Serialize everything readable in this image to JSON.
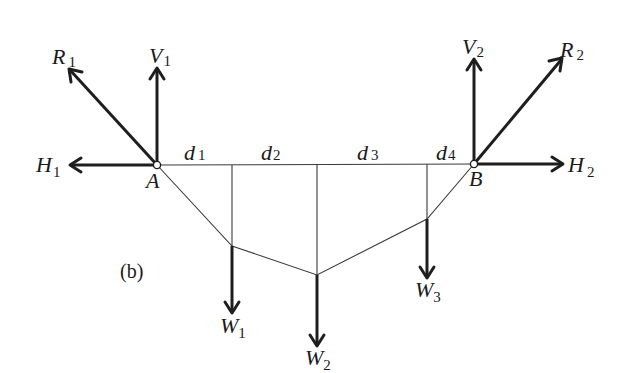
{
  "figure": {
    "caption": "(b)",
    "supports": [
      {
        "id": "A",
        "label": "A",
        "x": 157,
        "y": 165
      },
      {
        "id": "B",
        "label": "B",
        "x": 474,
        "y": 164
      }
    ],
    "reactions": {
      "R1": {
        "main": "R",
        "sub": "1",
        "from": [
          157,
          165
        ],
        "to": [
          69,
          69
        ]
      },
      "V1": {
        "main": "V",
        "sub": "1",
        "from": [
          157,
          165
        ],
        "to": [
          157,
          68
        ]
      },
      "H1": {
        "main": "H",
        "sub": "1",
        "from": [
          157,
          165
        ],
        "to": [
          70,
          165
        ]
      },
      "V2": {
        "main": "V",
        "sub": "2",
        "from": [
          474,
          164
        ],
        "to": [
          474,
          59
        ]
      },
      "R2": {
        "main": "R",
        "sub": "2",
        "from": [
          474,
          164
        ],
        "to": [
          562,
          58
        ]
      },
      "H2": {
        "main": "H",
        "sub": "2",
        "from": [
          474,
          164
        ],
        "to": [
          563,
          164
        ]
      }
    },
    "distances": [
      {
        "main": "d",
        "sub": "1"
      },
      {
        "main": "d",
        "sub": "2"
      },
      {
        "main": "d",
        "sub": "3"
      },
      {
        "main": "d",
        "sub": "4"
      }
    ],
    "cable_points": [
      [
        157,
        165
      ],
      [
        232,
        246
      ],
      [
        317,
        275
      ],
      [
        427,
        219
      ],
      [
        474,
        164
      ]
    ],
    "loads": [
      {
        "main": "W",
        "sub": "1",
        "x": 232,
        "from_y": 246,
        "to_y": 313
      },
      {
        "main": "W",
        "sub": "2",
        "x": 317,
        "from_y": 275,
        "to_y": 346
      },
      {
        "main": "W",
        "sub": "3",
        "x": 427,
        "from_y": 219,
        "to_y": 278
      }
    ],
    "colors": {
      "ink": "#1e1e1e",
      "background": "#ffffff"
    }
  }
}
